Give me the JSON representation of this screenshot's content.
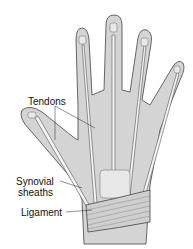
{
  "diagram": {
    "labels": {
      "tendons": "Tendons",
      "synovial_line1": "Synovial",
      "synovial_line2": "sheaths",
      "ligament": "Ligament"
    },
    "colors": {
      "skin": "#d4d4d4",
      "outline": "#444444",
      "tendon": "#f4f4f4",
      "bone": "#e8e8e8"
    }
  }
}
